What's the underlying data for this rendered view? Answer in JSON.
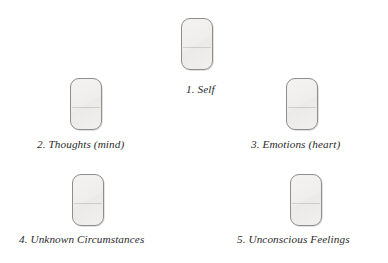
{
  "figure": {
    "background_color": "#ffffff",
    "node_fill_color": "#f0efed",
    "node_border_color": "#8d8d8d",
    "caption_color": "#2b2b2b",
    "nodes": [
      {
        "id": "1",
        "label": "1. Self",
        "shape": "rounded-rectangle"
      },
      {
        "id": "2",
        "label": "2. Thoughts (mind)",
        "shape": "rounded-rectangle"
      },
      {
        "id": "3",
        "label": "3. Emotions (heart)",
        "shape": "rounded-rectangle"
      },
      {
        "id": "4",
        "label": "4. Unknown Circumstances",
        "shape": "rounded-rectangle"
      },
      {
        "id": "5",
        "label": "5. Unconscious Feelings",
        "shape": "rounded-rectangle"
      }
    ]
  }
}
